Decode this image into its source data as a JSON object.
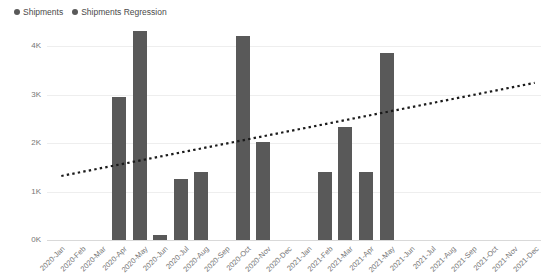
{
  "legend": {
    "position": "top-left",
    "entries": [
      {
        "label": "Shipments",
        "color": "#595959",
        "marker": "circle-dot"
      },
      {
        "label": "Shipments Regression",
        "color": "#595959",
        "marker": "circle-dot"
      }
    ]
  },
  "chart_data": {
    "type": "bar",
    "title": "",
    "subtitle": "",
    "xlabel": "",
    "ylabel": "",
    "ylim": [
      0,
      4500
    ],
    "yticks": [
      0,
      1000,
      2000,
      3000,
      4000
    ],
    "ytick_labels": [
      "0K",
      "1K",
      "2K",
      "3K",
      "4K"
    ],
    "grid": true,
    "grid_axis": "y",
    "bar_color": "#595959",
    "categories": [
      "2020-Jan",
      "2020-Feb",
      "2020-Mar",
      "2020-Apr",
      "2020-May",
      "2020-Jun",
      "2020-Jul",
      "2020-Aug",
      "2020-Sep",
      "2020-Oct",
      "2020-Nov",
      "2020-Dec",
      "2021-Jan",
      "2021-Feb",
      "2021-Mar",
      "2021-Apr",
      "2021-May",
      "2021-Jun",
      "2021-Jul",
      "2021-Aug",
      "2021-Sep",
      "2021-Oct",
      "2021-Nov",
      "2021-Dec"
    ],
    "series": [
      {
        "name": "Shipments",
        "type": "bar",
        "color": "#595959",
        "values": [
          0,
          0,
          0,
          2950,
          4300,
          100,
          1250,
          1400,
          0,
          4200,
          2020,
          0,
          0,
          1400,
          2320,
          1400,
          3850,
          0,
          0,
          0,
          0,
          0,
          0,
          0
        ]
      },
      {
        "name": "Shipments Regression",
        "type": "line",
        "style": "dotted",
        "color": "#1a1a1a",
        "start": {
          "x": "2020-Jan",
          "y": 1320
        },
        "end": {
          "x": "2021-Dec",
          "y": 3240
        }
      }
    ]
  }
}
